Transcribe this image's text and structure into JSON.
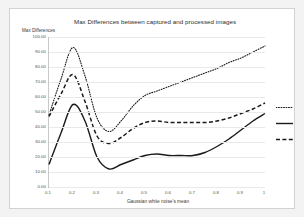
{
  "chart_data": {
    "type": "line",
    "title": "Max Differences between captured and processed images",
    "xlabel": "Gaussian white noise's mean",
    "ylabel": "Max Differences",
    "xlim": [
      0.1,
      1.0
    ],
    "ylim": [
      0,
      100
    ],
    "grid": true,
    "legend_position": "right",
    "x": [
      0.1,
      0.15,
      0.2,
      0.25,
      0.3,
      0.35,
      0.4,
      0.45,
      0.5,
      0.55,
      0.6,
      0.65,
      0.7,
      0.75,
      0.8,
      0.85,
      0.9,
      0.95,
      1.0
    ],
    "y_tick_labels": [
      "0.00",
      "10.00",
      "20.00",
      "30.00",
      "40.00",
      "50.00",
      "60.00",
      "70.00",
      "80.00",
      "90.00",
      "100.00"
    ],
    "y_ticks": [
      0,
      10,
      20,
      30,
      40,
      50,
      60,
      70,
      80,
      90,
      100
    ],
    "x_tick_labels": [
      "0.1",
      "0.2",
      "0.3",
      "0.4",
      "0.5",
      "0.6",
      "0.7",
      "0.8",
      "0.9",
      "1"
    ],
    "x_ticks": [
      0.1,
      0.2,
      0.3,
      0.4,
      0.5,
      0.6,
      0.7,
      0.8,
      0.9,
      1.0
    ],
    "series": [
      {
        "name": "series-dotted",
        "style": "dotted",
        "label": "",
        "color": "#1a1a1a",
        "values": [
          48,
          72,
          93,
          74,
          46,
          37,
          44,
          54,
          61,
          64,
          67,
          70,
          73,
          76,
          79,
          83,
          86,
          90,
          94
        ]
      },
      {
        "name": "series-solid",
        "style": "solid",
        "label": "",
        "color": "#1a1a1a",
        "values": [
          15,
          36,
          55,
          44,
          20,
          12,
          15,
          18,
          21,
          22,
          21,
          21,
          21,
          23,
          27,
          32,
          38,
          44,
          49
        ]
      },
      {
        "name": "series-dashed",
        "style": "dashed",
        "label": "",
        "color": "#1a1a1a",
        "values": [
          47,
          62,
          75,
          57,
          34,
          29,
          33,
          39,
          43,
          44,
          43,
          43,
          43,
          43,
          44,
          46,
          49,
          52,
          56
        ]
      }
    ]
  },
  "legend": {
    "items": [
      {
        "label": "",
        "style": "dotted"
      },
      {
        "label": "",
        "style": "solid"
      },
      {
        "label": "",
        "style": "dashed"
      }
    ]
  }
}
